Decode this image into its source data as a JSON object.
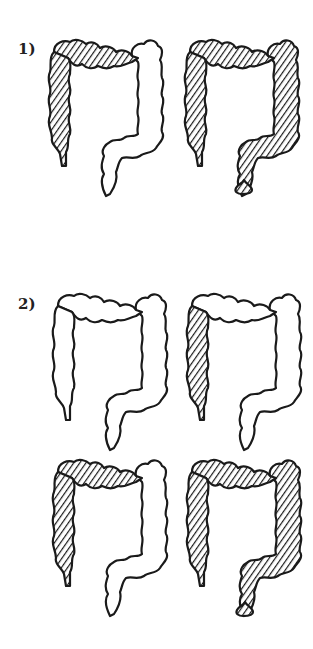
{
  "figure": {
    "background": "#ffffff",
    "ink_color": "#1a1a1a",
    "sections": [
      {
        "label": "1)",
        "panels": [
          {
            "name": "colon-partial-filling",
            "hatched_segments": [
              "cecum",
              "ascending",
              "transverse-proximal"
            ],
            "stool_drop": false
          },
          {
            "name": "colon-full-filling",
            "hatched_segments": [
              "cecum",
              "ascending",
              "transverse",
              "descending",
              "sigmoid",
              "rectum"
            ],
            "stool_drop": true
          }
        ]
      },
      {
        "label": "2)",
        "panels": [
          {
            "name": "colon-empty",
            "hatched_segments": [],
            "stool_drop": false
          },
          {
            "name": "colon-ascending-filling",
            "hatched_segments": [
              "cecum",
              "ascending"
            ],
            "stool_drop": false
          },
          {
            "name": "colon-partial-filling",
            "hatched_segments": [
              "cecum",
              "ascending",
              "transverse-proximal"
            ],
            "stool_drop": false
          },
          {
            "name": "colon-full-filling",
            "hatched_segments": [
              "cecum",
              "ascending",
              "transverse",
              "descending",
              "sigmoid",
              "rectum"
            ],
            "stool_drop": true
          }
        ]
      }
    ]
  }
}
